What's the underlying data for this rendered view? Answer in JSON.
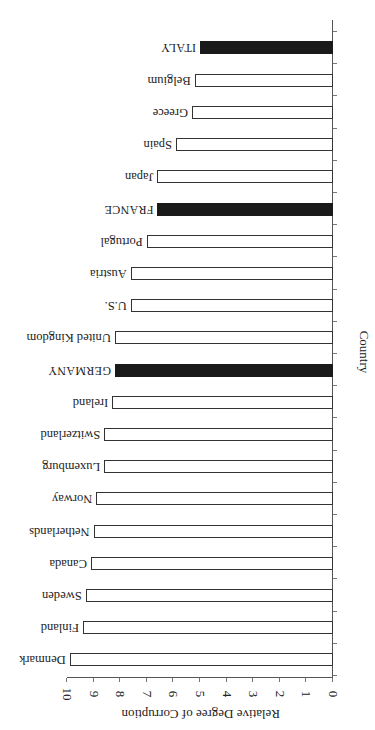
{
  "chart_data": {
    "type": "bar",
    "orientation": "horizontal",
    "rotation_degrees": 180,
    "title": "",
    "xlabel": "Relative Degree of Corruption",
    "ylabel": "Country",
    "xlim": [
      0,
      10
    ],
    "x_ticks": [
      "0",
      "1",
      "2",
      "3",
      "4",
      "5",
      "6",
      "7",
      "8",
      "9",
      "10"
    ],
    "grid": false,
    "legend": null,
    "categories": [
      "Denmark",
      "Finland",
      "Sweden",
      "Canada",
      "Netherlands",
      "Norway",
      "Luxemburg",
      "Switzerland",
      "Ireland",
      "GERMANY",
      "United Kingdom",
      "U.S.",
      "Austria",
      "Portugal",
      "FRANCE",
      "Japan",
      "Spain",
      "Greece",
      "Belgium",
      "ITALY"
    ],
    "values": [
      9.9,
      9.4,
      9.3,
      9.1,
      9.0,
      8.9,
      8.6,
      8.6,
      8.3,
      8.2,
      8.2,
      7.6,
      7.6,
      7.0,
      6.6,
      6.6,
      5.9,
      5.3,
      5.2,
      5.0
    ],
    "highlighted": [
      "GERMANY",
      "FRANCE",
      "ITALY"
    ],
    "colors": {
      "default_fill": "#ffffff",
      "highlight_fill": "#1a1a1a",
      "outline": "#333333"
    }
  }
}
